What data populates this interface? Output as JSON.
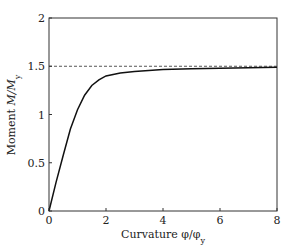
{
  "chart_data": {
    "type": "line",
    "title": "",
    "xlabel": "Curvature φ/φ",
    "xlabel_sub": "y",
    "ylabel": "Moment ",
    "ylabel_italic": "M/M",
    "ylabel_sub": "y",
    "xlim": [
      0,
      8
    ],
    "ylim": [
      0,
      2
    ],
    "xticks": [
      0,
      2,
      4,
      6,
      8
    ],
    "yticks": [
      0,
      0.5,
      1,
      1.5,
      2
    ],
    "ytick_labels": [
      "0",
      "0.5",
      "1",
      "1.5",
      "2"
    ],
    "xtick_labels": [
      "0",
      "2",
      "4",
      "6",
      "8"
    ],
    "grid": false,
    "legend": null,
    "series": [
      {
        "name": "moment-curvature",
        "style": "solid",
        "color": "#111111",
        "x": [
          0,
          0.25,
          0.5,
          0.75,
          1.0,
          1.25,
          1.5,
          1.75,
          2.0,
          2.5,
          3.0,
          4.0,
          5.0,
          6.0,
          7.0,
          8.0
        ],
        "y": [
          0,
          0.3,
          0.58,
          0.85,
          1.05,
          1.2,
          1.3,
          1.36,
          1.4,
          1.43,
          1.445,
          1.465,
          1.475,
          1.48,
          1.485,
          1.49
        ]
      }
    ],
    "reference_lines": [
      {
        "name": "plastic-moment-asymptote",
        "orientation": "horizontal",
        "y": 1.5,
        "style": "dashed",
        "color": "#444444"
      }
    ]
  },
  "layout": {
    "plot_left": 49,
    "plot_right": 277,
    "plot_top": 18,
    "plot_bottom": 211
  }
}
